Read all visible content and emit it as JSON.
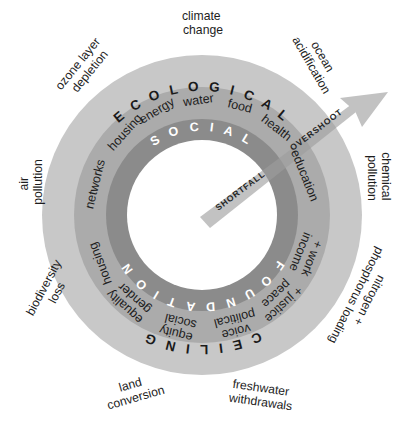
{
  "diagram": {
    "center": {
      "cx": 202,
      "cy": 215
    },
    "radii": {
      "outer_edge": 160,
      "ceiling_band_inner": 128,
      "dimension_band_inner": 96,
      "foundation_band_inner": 75
    },
    "colors": {
      "outer_ring": "#c8c8c8",
      "middle_ring": "#ababab",
      "inner_ring": "#8b8b8b",
      "hole": "#ffffff",
      "wedge": "#b8b8b8",
      "text_dark": "#1d1d1d",
      "text_light": "#ffffff",
      "outline": "#9a9a9a"
    }
  },
  "bands": {
    "outer_top_label": "E C O L O G I C A L",
    "outer_bottom_label": "C E I L I N G",
    "inner_top_label": "S O C I A L",
    "inner_bottom_label": "F O U N D A T I O N"
  },
  "overshoot_label": "OVERSHOOT",
  "shortfall_label": "SHORTFALL",
  "planetary_boundaries": [
    {
      "id": "climate-change",
      "lines": [
        "climate",
        "change"
      ]
    },
    {
      "id": "ocean-acidification",
      "lines": [
        "ocean",
        "acidification"
      ]
    },
    {
      "id": "chemical-pollution",
      "lines": [
        "chemical",
        "pollution"
      ]
    },
    {
      "id": "nitrogen-phosphorus-loading",
      "lines": [
        "nitrogen +",
        "phosphorus loading"
      ]
    },
    {
      "id": "freshwater-withdrawals",
      "lines": [
        "freshwater",
        "withdrawals"
      ]
    },
    {
      "id": "land-conversion",
      "lines": [
        "land",
        "conversion"
      ]
    },
    {
      "id": "biodiversity-loss",
      "lines": [
        "biodiversity",
        "loss"
      ]
    },
    {
      "id": "air-pollution",
      "lines": [
        "air",
        "pollution"
      ]
    },
    {
      "id": "ozone-layer-depletion",
      "lines": [
        "ozone layer",
        "depletion"
      ]
    }
  ],
  "social_dimensions": [
    {
      "id": "water",
      "lines": [
        "water"
      ]
    },
    {
      "id": "food",
      "lines": [
        "food"
      ]
    },
    {
      "id": "health",
      "lines": [
        "health"
      ]
    },
    {
      "id": "education",
      "lines": [
        "education"
      ]
    },
    {
      "id": "income-and-work",
      "lines": [
        "income",
        "+ work"
      ]
    },
    {
      "id": "peace-and-justice",
      "lines": [
        "peace",
        "+ justice"
      ]
    },
    {
      "id": "political-voice",
      "lines": [
        "political",
        "voice"
      ]
    },
    {
      "id": "social-equity",
      "lines": [
        "social",
        "equity"
      ]
    },
    {
      "id": "gender-equality",
      "lines": [
        "gender",
        "equality"
      ]
    },
    {
      "id": "housing",
      "lines": [
        "housing"
      ]
    },
    {
      "id": "networks",
      "lines": [
        "networks"
      ]
    },
    {
      "id": "housing-upper",
      "lines": [
        "housing"
      ]
    },
    {
      "id": "energy",
      "lines": [
        "energy"
      ]
    }
  ]
}
